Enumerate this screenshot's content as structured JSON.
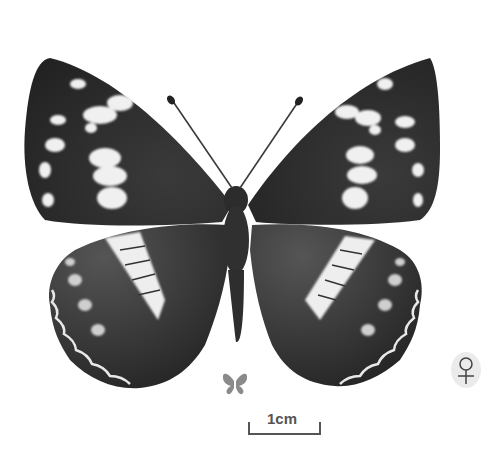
{
  "image": {
    "subject": "butterfly specimen, dorsal view",
    "colors": {
      "background": "#ffffff",
      "wing_dark": "#2a2a2a",
      "wing_mid": "#4a4a4a",
      "band_white": "#f2f2f2",
      "mini_icon": "#8a8a8a",
      "scale_bar": "#555555"
    }
  },
  "scale_bar": {
    "label": "1cm"
  },
  "size_reference_icon": "butterfly-silhouette-icon",
  "sex_marker": {
    "symbol": "♀",
    "meaning": "female"
  }
}
